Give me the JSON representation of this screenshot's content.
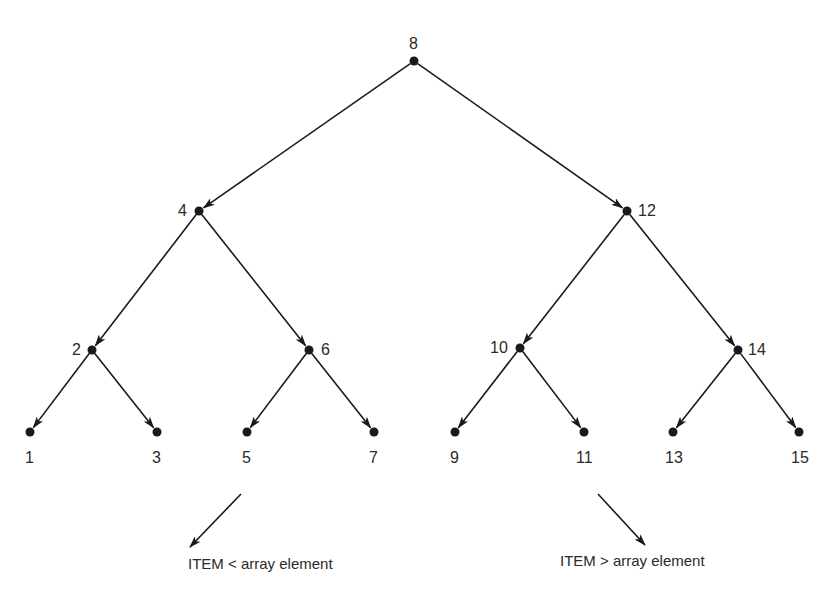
{
  "diagram": {
    "type": "binary-search-tree",
    "nodes": [
      {
        "id": "8",
        "label": "8",
        "x": 414,
        "y": 61,
        "lx": 409,
        "ly": 36
      },
      {
        "id": "4",
        "label": "4",
        "x": 199,
        "y": 211,
        "lx": 178,
        "ly": 203
      },
      {
        "id": "12",
        "label": "12",
        "x": 627,
        "y": 211,
        "lx": 638,
        "ly": 203
      },
      {
        "id": "2",
        "label": "2",
        "x": 92,
        "y": 350,
        "lx": 72,
        "ly": 342
      },
      {
        "id": "6",
        "label": "6",
        "x": 309,
        "y": 350,
        "lx": 321,
        "ly": 342
      },
      {
        "id": "10",
        "label": "10",
        "x": 520,
        "y": 348,
        "lx": 490,
        "ly": 340
      },
      {
        "id": "14",
        "label": "14",
        "x": 738,
        "y": 350,
        "lx": 748,
        "ly": 342
      },
      {
        "id": "1",
        "label": "1",
        "x": 30,
        "y": 432,
        "lx": 25,
        "ly": 450
      },
      {
        "id": "3",
        "label": "3",
        "x": 157,
        "y": 432,
        "lx": 152,
        "ly": 450
      },
      {
        "id": "5",
        "label": "5",
        "x": 247,
        "y": 432,
        "lx": 242,
        "ly": 450
      },
      {
        "id": "7",
        "label": "7",
        "x": 374,
        "y": 432,
        "lx": 369,
        "ly": 450
      },
      {
        "id": "9",
        "label": "9",
        "x": 455,
        "y": 432,
        "lx": 450,
        "ly": 450
      },
      {
        "id": "11",
        "label": "11",
        "x": 584,
        "y": 432,
        "lx": 576,
        "ly": 450
      },
      {
        "id": "13",
        "label": "13",
        "x": 673,
        "y": 432,
        "lx": 665,
        "ly": 450
      },
      {
        "id": "15",
        "label": "15",
        "x": 799,
        "y": 432,
        "lx": 791,
        "ly": 450
      }
    ],
    "edges": [
      [
        "8",
        "4"
      ],
      [
        "8",
        "12"
      ],
      [
        "4",
        "2"
      ],
      [
        "4",
        "6"
      ],
      [
        "12",
        "10"
      ],
      [
        "12",
        "14"
      ],
      [
        "2",
        "1"
      ],
      [
        "2",
        "3"
      ],
      [
        "6",
        "5"
      ],
      [
        "6",
        "7"
      ],
      [
        "10",
        "9"
      ],
      [
        "10",
        "11"
      ],
      [
        "14",
        "13"
      ],
      [
        "14",
        "15"
      ]
    ],
    "annotations": [
      {
        "id": "left",
        "text": "ITEM < array element",
        "arrow": {
          "x1": 241,
          "y1": 494,
          "x2": 190,
          "y2": 547
        },
        "tx": 188,
        "ty": 556
      },
      {
        "id": "right",
        "text": "ITEM > array element",
        "arrow": {
          "x1": 598,
          "y1": 494,
          "x2": 645,
          "y2": 545
        },
        "tx": 560,
        "ty": 553
      }
    ],
    "colors": {
      "ink": "#1a1a1a",
      "text": "#2a2a2a",
      "background": "#ffffff"
    }
  }
}
